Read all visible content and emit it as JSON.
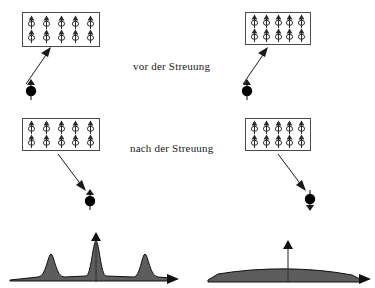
{
  "figure": {
    "title_row_before": "vor der Streuung",
    "title_row_after": "nach der Streuung",
    "ink": "#1a1a1a",
    "fill": "#5a5a5a",
    "box_stroke": "#4a4a4a"
  },
  "captions": {
    "before": "vor der Streuung",
    "after": "nach der Streuung"
  },
  "panels": {
    "left_before": {
      "lattice_rows": 2,
      "lattice_cols": 5,
      "spin_directions": [
        [
          "up",
          "up",
          "up",
          "up",
          "up"
        ],
        [
          "up",
          "up",
          "up",
          "up",
          "up"
        ]
      ]
    },
    "right_before": {
      "lattice_rows": 2,
      "lattice_cols": 5,
      "spin_directions": [
        [
          "up",
          "up",
          "up",
          "up",
          "up"
        ],
        [
          "up",
          "up",
          "up",
          "up",
          "up"
        ]
      ]
    },
    "left_after": {
      "lattice_rows": 2,
      "lattice_cols": 5,
      "spin_directions": [
        [
          "up",
          "up",
          "up",
          "up",
          "up"
        ],
        [
          "up",
          "up",
          "up",
          "up",
          "up"
        ]
      ]
    },
    "right_after": {
      "lattice_rows": 2,
      "lattice_cols": 5,
      "spin_directions": [
        [
          "up",
          "up",
          "up",
          "up",
          "up"
        ],
        [
          "up",
          "up",
          "up",
          "up",
          "up"
        ]
      ]
    }
  },
  "particles": {
    "incoming_left": {
      "spin": "up",
      "label": "neutron"
    },
    "incoming_right": {
      "spin": "up",
      "label": "neutron"
    },
    "outgoing_left": {
      "spin": "up",
      "label": "neutron"
    },
    "outgoing_right": {
      "spin": "down",
      "label": "neutron"
    }
  },
  "chart_data": [
    {
      "type": "line",
      "name": "coherent-bragg-pattern",
      "title": "",
      "xlabel": "",
      "ylabel": "",
      "grid": false,
      "legend": null,
      "xlim": [
        0,
        100
      ],
      "ylim": [
        0,
        100
      ],
      "baseline": 8,
      "peaks": [
        {
          "center": 22,
          "height": 58,
          "width": 4
        },
        {
          "center": 50,
          "height": 86,
          "width": 4
        },
        {
          "center": 78,
          "height": 56,
          "width": 4
        }
      ],
      "center_axis_arrow": {
        "x": 50,
        "height": 100
      },
      "x_axis_arrow": true
    },
    {
      "type": "line",
      "name": "diffuse-pattern",
      "title": "",
      "xlabel": "",
      "ylabel": "",
      "grid": false,
      "legend": null,
      "xlim": [
        0,
        100
      ],
      "ylim": [
        0,
        100
      ],
      "baseline": 8,
      "peaks": [
        {
          "center": 50,
          "height": 20,
          "width": 70
        }
      ],
      "center_axis_arrow": {
        "x": 50,
        "height": 78
      },
      "x_axis_arrow": true
    }
  ]
}
